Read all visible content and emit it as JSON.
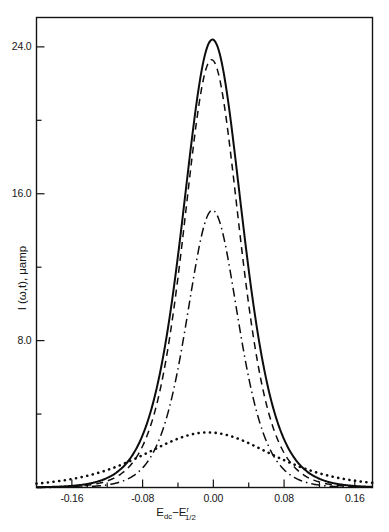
{
  "chart_data": {
    "type": "line",
    "title": "",
    "xlabel": "E_dc - E^r_1/2",
    "xlabel_parts": {
      "base1": "E",
      "sub1": "dc",
      "minus": "−",
      "base2": "E",
      "sup2": "r",
      "sub2": "1/2"
    },
    "ylabel": "I (ω,t), μamp",
    "ylabel_parts": {
      "symbol": "I",
      "args": "(ω,t)",
      "comma": ",",
      "units": "μamp"
    },
    "xlim": [
      -0.2,
      0.18
    ],
    "ylim": [
      0.0,
      25.6
    ],
    "xticks": [
      -0.16,
      -0.08,
      0.0,
      0.08,
      0.16
    ],
    "xtick_labels": [
      "-0.16",
      "-0.08",
      "0.00",
      "0.08",
      "0.16"
    ],
    "xticks_minor": [
      -0.12,
      -0.04,
      0.04,
      0.12
    ],
    "yticks": [
      8.0,
      16.0,
      24.0
    ],
    "ytick_labels": [
      "8.0",
      "16.0",
      "24.0"
    ],
    "yticks_minor": [
      4.0,
      12.0,
      20.0
    ],
    "grid": false,
    "legend": "none",
    "axis_color": "#141414",
    "curve_color": "#0d0d0d",
    "series": [
      {
        "name": "curve-solid",
        "style": "solid",
        "peak_x": -0.001,
        "peak_y": 24.4,
        "half_width": 0.0455,
        "shape": "sech2",
        "x": [
          -0.2,
          -0.19,
          -0.18,
          -0.17,
          -0.16,
          -0.15,
          -0.14,
          -0.13,
          -0.12,
          -0.11,
          -0.1,
          -0.09,
          -0.08,
          -0.07,
          -0.06,
          -0.05,
          -0.04,
          -0.03,
          -0.02,
          -0.01,
          0.0,
          0.01,
          0.02,
          0.03,
          0.04,
          0.05,
          0.06,
          0.07,
          0.08,
          0.09,
          0.1,
          0.11,
          0.12,
          0.13,
          0.14,
          0.15,
          0.16,
          0.17,
          0.18
        ],
        "y": [
          0.3,
          0.39,
          0.5,
          0.65,
          0.85,
          1.11,
          1.46,
          1.93,
          2.56,
          3.41,
          4.54,
          6.03,
          7.95,
          10.3,
          12.97,
          15.73,
          18.25,
          20.25,
          21.64,
          22.45,
          22.7,
          22.45,
          21.64,
          20.25,
          18.25,
          15.73,
          12.97,
          10.3,
          7.95,
          6.03,
          4.54,
          3.41,
          2.56,
          1.93,
          1.46,
          1.11,
          0.85,
          0.65,
          0.5
        ]
      },
      {
        "name": "curve-dashed",
        "style": "dashed",
        "peak_x": -0.002,
        "peak_y": 23.3,
        "half_width": 0.0425,
        "shape": "sech2",
        "x": [
          -0.2,
          -0.18,
          -0.16,
          -0.14,
          -0.12,
          -0.1,
          -0.08,
          -0.06,
          -0.04,
          -0.02,
          0.0,
          0.02,
          0.04,
          0.06,
          0.08,
          0.1,
          0.12,
          0.14,
          0.16,
          0.18
        ],
        "y": [
          0.22,
          0.38,
          0.66,
          1.14,
          1.96,
          3.33,
          5.58,
          9.0,
          13.55,
          18.35,
          21.5,
          18.35,
          13.55,
          9.0,
          5.58,
          3.33,
          1.96,
          1.14,
          0.66,
          0.38
        ]
      },
      {
        "name": "curve-dashdot",
        "style": "dashdot",
        "peak_x": -0.001,
        "peak_y": 15.1,
        "half_width": 0.0395,
        "shape": "sech2",
        "x": [
          -0.2,
          -0.18,
          -0.16,
          -0.14,
          -0.12,
          -0.1,
          -0.08,
          -0.06,
          -0.04,
          -0.02,
          0.0,
          0.02,
          0.04,
          0.06,
          0.08,
          0.1,
          0.12,
          0.14,
          0.16,
          0.18
        ],
        "y": [
          0.11,
          0.2,
          0.35,
          0.63,
          1.12,
          1.97,
          3.43,
          5.8,
          9.17,
          12.95,
          15.1,
          12.95,
          9.17,
          5.8,
          3.43,
          1.97,
          1.12,
          0.63,
          0.35,
          0.2
        ]
      },
      {
        "name": "curve-dotted",
        "style": "dotted",
        "peak_x": -0.006,
        "peak_y": 3.0,
        "half_width": 0.097,
        "shape": "sech2",
        "x": [
          -0.2,
          -0.18,
          -0.16,
          -0.14,
          -0.12,
          -0.1,
          -0.08,
          -0.06,
          -0.04,
          -0.02,
          0.0,
          0.02,
          0.04,
          0.06,
          0.08,
          0.1,
          0.12,
          0.14,
          0.16,
          0.18
        ],
        "y": [
          0.33,
          0.49,
          0.72,
          1.03,
          1.43,
          1.88,
          2.33,
          2.7,
          2.93,
          3.0,
          2.93,
          2.72,
          2.39,
          2.0,
          1.59,
          1.22,
          0.91,
          0.66,
          0.47,
          0.34
        ]
      }
    ]
  }
}
